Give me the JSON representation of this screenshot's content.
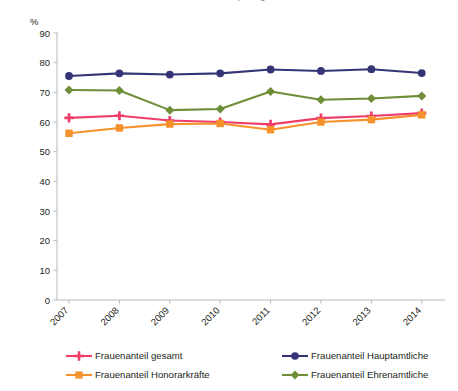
{
  "clipped_title": "Frauenanteile in den Sportorganisationen, 2007 bis 2014",
  "axis": {
    "unit_label": "%",
    "y_ticks": [
      "90",
      "80",
      "70",
      "60",
      "50",
      "40",
      "30",
      "20",
      "10",
      "0"
    ],
    "y_min": 0,
    "y_max": 90,
    "x_ticks": [
      "2007",
      "2008",
      "2009",
      "2010",
      "2011",
      "2012",
      "2013",
      "2014"
    ]
  },
  "legend": {
    "items": [
      {
        "label": "Frauenanteil gesamt",
        "color": "#ee3d6b",
        "marker": "plus"
      },
      {
        "label": "Frauenanteil Honorarkräfte",
        "color": "#f5922b",
        "marker": "square"
      },
      {
        "label": "Frauenanteil Hauptamtliche",
        "color": "#343476",
        "marker": "circle"
      },
      {
        "label": "Frauenanteil Ehrenamtliche",
        "color": "#6e8e38",
        "marker": "diamond"
      }
    ]
  },
  "chart_data": {
    "type": "line",
    "title": "Frauenanteile in den Sportorganisationen, 2007 bis 2014",
    "xlabel": "",
    "ylabel": "%",
    "ylim": [
      0,
      90
    ],
    "grid": false,
    "legend_position": "bottom",
    "categories": [
      "2007",
      "2008",
      "2009",
      "2010",
      "2011",
      "2012",
      "2013",
      "2014"
    ],
    "series": [
      {
        "name": "Frauenanteil gesamt",
        "color": "#ee3d6b",
        "marker": "plus",
        "values": [
          61.4,
          62.1,
          60.5,
          60.0,
          59.2,
          61.3,
          62.0,
          63.0
        ]
      },
      {
        "name": "Frauenanteil Honorarkräfte",
        "color": "#f5922b",
        "marker": "square",
        "values": [
          56.2,
          58.0,
          59.3,
          59.5,
          57.4,
          60.0,
          60.8,
          62.4
        ]
      },
      {
        "name": "Frauenanteil Hauptamtliche",
        "color": "#343476",
        "marker": "circle",
        "values": [
          75.5,
          76.4,
          76.0,
          76.4,
          77.7,
          77.2,
          77.8,
          76.5
        ]
      },
      {
        "name": "Frauenanteil Ehrenamtliche",
        "color": "#6e8e38",
        "marker": "diamond",
        "values": [
          70.8,
          70.6,
          64.0,
          64.4,
          70.3,
          67.5,
          67.9,
          68.8
        ]
      }
    ]
  }
}
